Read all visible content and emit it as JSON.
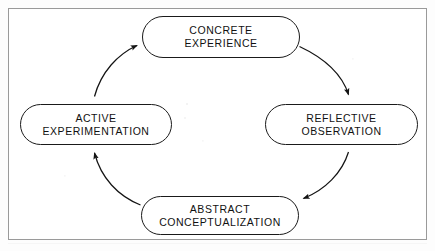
{
  "diagram": {
    "type": "cycle-diagram",
    "background_color": "#ffffff",
    "frame_color": "#9a9a9a",
    "node_border_color": "#1a1a1a",
    "arrow_color": "#1a1a1a",
    "nodes": [
      {
        "id": "concrete-experience",
        "position": "top",
        "line1": "CONCRETE",
        "line2": "EXPERIENCE"
      },
      {
        "id": "reflective-observation",
        "position": "right",
        "line1": "REFLECTIVE",
        "line2": "OBSERVATION"
      },
      {
        "id": "abstract-conceptualization",
        "position": "bottom",
        "line1": "ABSTRACT",
        "line2": "CONCEPTUALIZATION"
      },
      {
        "id": "active-experimentation",
        "position": "left",
        "line1": "ACTIVE",
        "line2": "EXPERIMENTATION"
      }
    ],
    "arrows": [
      {
        "id": "arrow-ce-to-ro",
        "from": "concrete-experience",
        "to": "reflective-observation",
        "direction": "clockwise"
      },
      {
        "id": "arrow-ro-to-ac",
        "from": "reflective-observation",
        "to": "abstract-conceptualization",
        "direction": "clockwise"
      },
      {
        "id": "arrow-ac-to-ae",
        "from": "abstract-conceptualization",
        "to": "active-experimentation",
        "direction": "clockwise"
      },
      {
        "id": "arrow-ae-to-ce",
        "from": "active-experimentation",
        "to": "concrete-experience",
        "direction": "clockwise"
      }
    ]
  }
}
